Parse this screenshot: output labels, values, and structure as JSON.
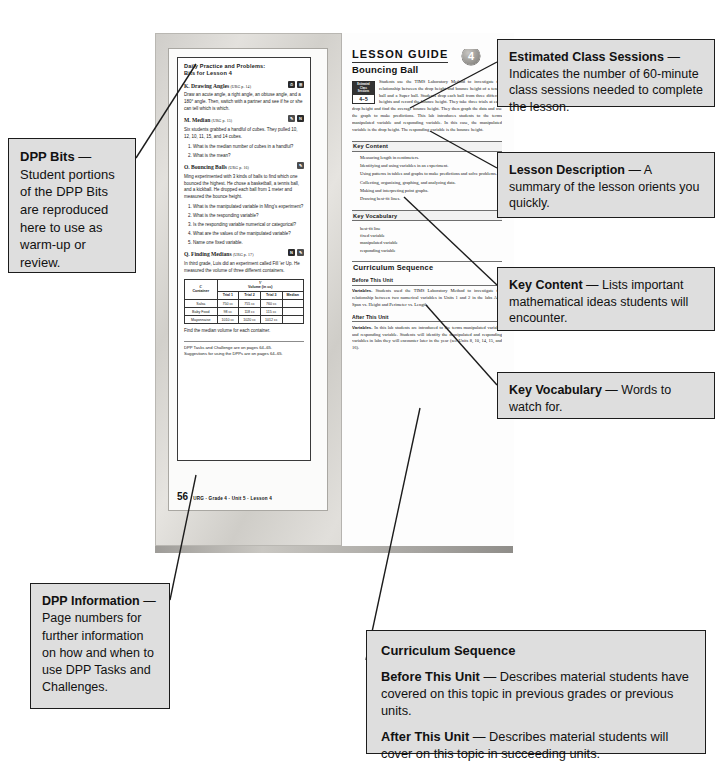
{
  "document": {
    "kind": "annotated-textbook-spread",
    "page_number": "56",
    "page_footer": "URG · Grade 4 · Unit 5 · Lesson 4"
  },
  "dpp": {
    "title_line1": "Daily Practice and Problems:",
    "title_line2": "Bits for Lesson 4",
    "bits": [
      {
        "letter": "K.",
        "name": "Drawing Angles",
        "ref": "(URG p. 14)",
        "icons": [
          "clock-icon",
          "calculator-icon"
        ],
        "body": "Draw an acute angle, a right angle, an obtuse angle, and a 180° angle. Then, switch with a partner and see if he or she can tell which is which.",
        "questions": []
      },
      {
        "letter": "M.",
        "name": "Median",
        "ref": "(URG p. 15)",
        "icons": [
          "pencil-icon",
          "n-icon"
        ],
        "body": "Six students grabbed a handful of cubes. They pulled 10, 12, 10, 11, 15, and 14 cubes.",
        "questions": [
          "What is the median number of cubes in a handful?",
          "What is the mean?"
        ]
      },
      {
        "letter": "O.",
        "name": "Bouncing Balls",
        "ref": "(URG p. 16)",
        "icons": [
          "pencil-icon"
        ],
        "body": "Ming experimented with 3 kinds of balls to find which one bounced the highest. He chose a basketball, a tennis ball, and a kickball. He dropped each ball from 1 meter and measured the bounce height.",
        "questions": [
          "What is the manipulated variable in Ming's experiment?",
          "What is the responding variable?",
          "Is the responding variable numerical or categorical?",
          "What are the values of the manipulated variable?",
          "Name one fixed variable."
        ]
      },
      {
        "letter": "Q.",
        "name": "Finding Medians",
        "ref": "(URG p. 17)",
        "icons": [
          "n-icon",
          "pencil-icon"
        ],
        "body": "In third grade, Luis did an experiment called Fill 'er Up. He measured the volume of three different containers.",
        "questions": []
      }
    ],
    "table": {
      "col1_var": "C",
      "col1_label": "Container",
      "group_var": "V",
      "group_label": "Volume (in cc)",
      "subheaders": [
        "Trial 1",
        "Trial 2",
        "Trial 3",
        "Median"
      ],
      "rows": [
        {
          "container": "Salsa",
          "trial1": "750 cc",
          "trial2": "755 cc",
          "trial3": "760 cc",
          "median": ""
        },
        {
          "container": "Baby Food",
          "trial1": "98 cc",
          "trial2": "118 cc",
          "trial3": "115 cc",
          "median": ""
        },
        {
          "container": "Mayonnaise",
          "trial1": "1010 cc",
          "trial2": "1020 cc",
          "trial3": "1012 cc",
          "median": ""
        }
      ]
    },
    "after_table": "Find the median volume for each container.",
    "footer_line1": "DPP Tasks and Challenge are on pages 64–65.",
    "footer_line2": "Suggestions for using the DPPs are on pages 64–65."
  },
  "lesson_guide": {
    "header": "LESSON GUIDE",
    "unit_badge": "4",
    "lesson_title": "Bouncing Ball",
    "sessions_caption_l1": "Estimated",
    "sessions_caption_l2": "Class",
    "sessions_caption_l3": "Sessions",
    "sessions_value": "4–5",
    "description": "Students use the TIMS Laboratory Method to investigate the relationship between the drop height and bounce height of a tennis ball and a Super ball. Students drop each ball from three different heights and record the bounce height. They take three trials at each drop height and find the average bounce height. They then graph the data and use the graph to make predictions. This lab introduces students to the terms manipulated variable and responding variable. In this case, the manipulated variable is the drop height. The responding variable is the bounce height.",
    "key_content_heading": "Key Content",
    "key_content": [
      "Measuring length in centimeters.",
      "Identifying and using variables in an experiment.",
      "Using patterns in tables and graphs to make predictions and solve problems.",
      "Collecting, organizing, graphing, and analyzing data.",
      "Making and interpreting point graphs.",
      "Drawing best-fit lines."
    ],
    "key_vocabulary_heading": "Key Vocabulary",
    "key_vocabulary": [
      "best-fit line",
      "fixed variable",
      "manipulated variable",
      "responding variable"
    ],
    "curriculum_heading": "Curriculum Sequence",
    "before_heading": "Before This Unit",
    "before_label": "Variables.",
    "before_text": "Students used the TIMS Laboratory Method to investigate the relationship between two numerical variables in Units 1 and 2 in the labs Arm Span vs. Height and Perimeter vs. Length.",
    "after_heading": "After This Unit",
    "after_label": "Variables.",
    "after_text": "In this lab students are introduced to the terms manipulated variable and responding variable. Students will identify the manipulated and responding variables in labs they will encounter later in the year (see Units 8, 10, 14, 15, and 16)."
  },
  "callouts": {
    "dpp_bits": {
      "label": "DPP Bits",
      "dash": " — ",
      "text": "Student portions of the DPP Bits are reproduced here to use as warm-up or review."
    },
    "sessions": {
      "label": "Estimated Class Sessions",
      "dash": " — ",
      "text": "Indicates the number of 60-minute class sessions needed to complete the lesson."
    },
    "lesson_description": {
      "label": "Lesson Description",
      "dash": " — ",
      "text": "A summary of the lesson orients you quickly."
    },
    "key_content": {
      "label": "Key Content",
      "dash": " — ",
      "text": "Lists important mathematical ideas students will encounter."
    },
    "key_vocabulary": {
      "label": "Key Vocabulary",
      "dash": " — ",
      "text": "Words to watch for."
    },
    "dpp_information": {
      "label": "DPP Information",
      "dash": " — ",
      "text": "Page numbers for further information on how and when to use DPP Tasks and Challenges."
    },
    "curriculum": {
      "title": "Curriculum Sequence",
      "before_label": "Before This Unit",
      "before_dash": " — ",
      "before_text": "Describes material students have covered on this topic in previous grades or previous units.",
      "after_label": "After This Unit",
      "after_dash": " — ",
      "after_text": "Describes material students will cover on this topic in succeeding units."
    }
  }
}
